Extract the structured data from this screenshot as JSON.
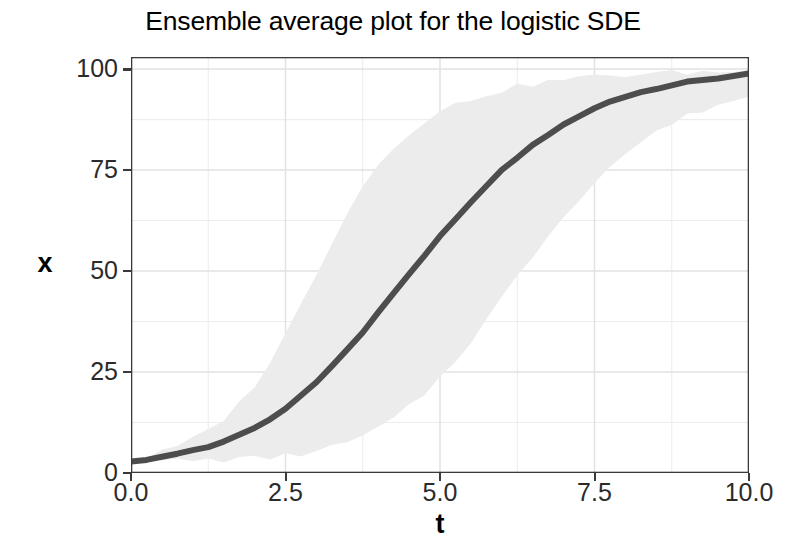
{
  "chart_data": {
    "type": "line",
    "title": "Ensemble average plot for the logistic SDE",
    "xlabel": "t",
    "ylabel": "x",
    "xlim": [
      0,
      10
    ],
    "ylim": [
      0,
      103
    ],
    "grid": true,
    "legend": "none",
    "xticks": [
      "0.0",
      "2.5",
      "5.0",
      "7.5",
      "10.0"
    ],
    "xtick_values": [
      0,
      2.5,
      5,
      7.5,
      10
    ],
    "yticks": [
      "0",
      "25",
      "50",
      "75",
      "100"
    ],
    "ytick_values": [
      0,
      25,
      50,
      75,
      100
    ],
    "x_minor_values": [
      1.25,
      3.75,
      6.25,
      8.75
    ],
    "y_minor_values": [
      12.5,
      37.5,
      62.5,
      87.5
    ],
    "colors": {
      "mean_line": "#4d4d4d",
      "ribbon_fill": "#ececec",
      "panel_background": "#ffffff",
      "major_gridline": "#e2e2e2",
      "minor_gridline": "#ededed",
      "panel_border": "#3a3a3a",
      "axis_text": "#2b2b2b",
      "title_text": "#000000"
    },
    "series": [
      {
        "name": "ensemble mean",
        "x": [
          0,
          0.25,
          0.5,
          0.75,
          1,
          1.25,
          1.5,
          1.75,
          2,
          2.25,
          2.5,
          2.75,
          3,
          3.25,
          3.5,
          3.75,
          4,
          4.25,
          4.5,
          4.75,
          5,
          5.25,
          5.5,
          5.75,
          6,
          6.25,
          6.5,
          6.75,
          7,
          7.25,
          7.5,
          7.75,
          8,
          8.25,
          8.5,
          8.75,
          9,
          9.25,
          9.5,
          9.75,
          10
        ],
        "values": [
          3.1,
          3.4,
          3.9,
          4.6,
          5.4,
          6.4,
          7.7,
          9.2,
          11.1,
          13.3,
          16.0,
          19.0,
          22.4,
          26.3,
          30.4,
          34.8,
          39.6,
          44.4,
          49.2,
          54.0,
          58.6,
          63.1,
          67.3,
          71.2,
          74.8,
          78.2,
          81.2,
          83.8,
          86.2,
          88.3,
          90.1,
          91.7,
          93.0,
          94.2,
          95.2,
          96.0,
          96.7,
          97.3,
          97.8,
          98.3,
          98.7
        ]
      },
      {
        "name": "ensemble upper envelope",
        "x": [
          0,
          0.25,
          0.5,
          0.75,
          1,
          1.25,
          1.5,
          1.75,
          2,
          2.25,
          2.5,
          2.75,
          3,
          3.25,
          3.5,
          3.75,
          4,
          4.25,
          4.5,
          4.75,
          5,
          5.25,
          5.5,
          5.75,
          6,
          6.25,
          6.5,
          6.75,
          7,
          7.25,
          7.5,
          7.75,
          8,
          8.25,
          8.5,
          8.75,
          9,
          9.25,
          9.5,
          9.75,
          10
        ],
        "values": [
          3.2,
          4.0,
          5.1,
          6.5,
          8.3,
          10.6,
          13.5,
          17.2,
          21.9,
          27.6,
          34.3,
          41.7,
          49.6,
          57.4,
          64.7,
          71.0,
          76.4,
          80.8,
          84.4,
          87.2,
          89.4,
          91.2,
          92.6,
          93.8,
          94.8,
          95.6,
          96.3,
          96.9,
          97.4,
          97.8,
          98.1,
          98.4,
          98.6,
          98.8,
          99.0,
          99.1,
          99.2,
          99.3,
          99.4,
          99.5,
          99.6
        ]
      },
      {
        "name": "ensemble lower envelope",
        "x": [
          0,
          0.25,
          0.5,
          0.75,
          1,
          1.25,
          1.5,
          1.75,
          2,
          2.25,
          2.5,
          2.75,
          3,
          3.25,
          3.5,
          3.75,
          4,
          4.25,
          4.5,
          4.75,
          5,
          5.25,
          5.5,
          5.75,
          6,
          6.25,
          6.5,
          6.75,
          7,
          7.25,
          7.5,
          7.75,
          8,
          8.25,
          8.5,
          8.75,
          9,
          9.25,
          9.5,
          9.75,
          10
        ],
        "values": [
          3.0,
          3.0,
          3.0,
          3.1,
          3.1,
          3.2,
          3.3,
          3.4,
          3.6,
          3.9,
          4.2,
          4.7,
          5.4,
          6.3,
          7.5,
          9.0,
          11.0,
          13.4,
          16.3,
          19.7,
          23.6,
          28.0,
          32.8,
          37.9,
          43.2,
          48.5,
          53.8,
          58.9,
          63.7,
          68.1,
          72.2,
          75.8,
          79.1,
          81.9,
          84.4,
          86.5,
          88.3,
          89.9,
          91.2,
          92.3,
          93.2
        ]
      }
    ]
  }
}
